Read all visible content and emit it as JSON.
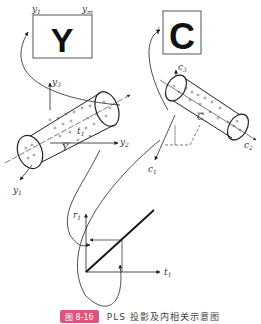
{
  "boxes": {
    "y_box": {
      "letter": "Y",
      "label_left": "y1",
      "label_right": "ym"
    },
    "c_box": {
      "letter": "C",
      "label_i": "i"
    }
  },
  "left_cylinder": {
    "axes": {
      "y1": "y1",
      "y2": "y2",
      "y3": "y3"
    },
    "labels": {
      "t1": "t1",
      "ybar": "Y"
    }
  },
  "right_cylinder": {
    "axes": {
      "c1": "c1",
      "c2": "c2",
      "c3": "c3"
    },
    "labels": {
      "cbar": "C"
    }
  },
  "inner_plot": {
    "x_axis": "t1",
    "y_axis": "r1"
  },
  "caption": {
    "badge": "图 8-16",
    "text": "PLS 投影及内相关示意图"
  },
  "colors": {
    "line": "#222222",
    "badge": "#d9577a"
  }
}
